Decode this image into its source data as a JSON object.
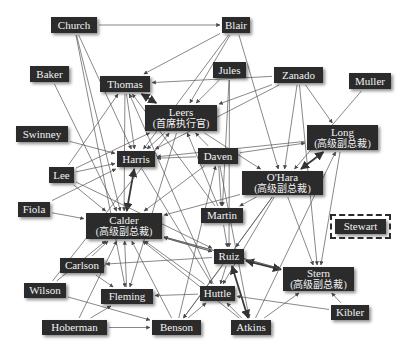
{
  "diagram": {
    "type": "org-network",
    "colors": {
      "node_fill": "#2b2b2b",
      "node_text": "#f2f2f2",
      "edge": "#555555",
      "background": "#ffffff"
    },
    "nodes": [
      {
        "id": "church",
        "label": "Church",
        "sub": "",
        "x": 51,
        "y": 17,
        "w": 46,
        "h": 16
      },
      {
        "id": "blair",
        "label": "Blair",
        "sub": "",
        "x": 222,
        "y": 17,
        "w": 28,
        "h": 16
      },
      {
        "id": "baker",
        "label": "Baker",
        "sub": "",
        "x": 30,
        "y": 66,
        "w": 39,
        "h": 16
      },
      {
        "id": "thomas",
        "label": "Thomas",
        "sub": "",
        "x": 100,
        "y": 76,
        "w": 50,
        "h": 16
      },
      {
        "id": "jules",
        "label": "Jules",
        "sub": "",
        "x": 213,
        "y": 62,
        "w": 33,
        "h": 16
      },
      {
        "id": "zanado",
        "label": "Zanado",
        "sub": "",
        "x": 274,
        "y": 67,
        "w": 49,
        "h": 16
      },
      {
        "id": "muller",
        "label": "Muller",
        "sub": "",
        "x": 349,
        "y": 73,
        "w": 42,
        "h": 16
      },
      {
        "id": "leers",
        "label": "Leers",
        "sub": "(首席执行官)",
        "x": 145,
        "y": 105,
        "w": 72,
        "h": 26
      },
      {
        "id": "swinney",
        "label": "Swinney",
        "sub": "",
        "x": 16,
        "y": 126,
        "w": 52,
        "h": 16
      },
      {
        "id": "long",
        "label": "Long",
        "sub": "(高级副总裁)",
        "x": 307,
        "y": 125,
        "w": 71,
        "h": 25
      },
      {
        "id": "harris",
        "label": "Harris",
        "sub": "",
        "x": 117,
        "y": 151,
        "w": 38,
        "h": 16
      },
      {
        "id": "daven",
        "label": "Daven",
        "sub": "",
        "x": 198,
        "y": 148,
        "w": 40,
        "h": 16
      },
      {
        "id": "lee",
        "label": "Lee",
        "sub": "",
        "x": 49,
        "y": 167,
        "w": 25,
        "h": 16
      },
      {
        "id": "ohara",
        "label": "O'Hara",
        "sub": "(高级副总裁)",
        "x": 242,
        "y": 171,
        "w": 81,
        "h": 24
      },
      {
        "id": "fiola",
        "label": "Fiola",
        "sub": "",
        "x": 18,
        "y": 202,
        "w": 32,
        "h": 15
      },
      {
        "id": "stewart",
        "label": "Stewart",
        "sub": "",
        "x": 335,
        "y": 219,
        "w": 51,
        "h": 15,
        "dashed": true
      },
      {
        "id": "martin",
        "label": "Martin",
        "sub": "",
        "x": 201,
        "y": 208,
        "w": 42,
        "h": 15
      },
      {
        "id": "calder",
        "label": "Calder",
        "sub": "(高级副总裁)",
        "x": 86,
        "y": 213,
        "w": 76,
        "h": 26
      },
      {
        "id": "carlson",
        "label": "Carlson",
        "sub": "",
        "x": 60,
        "y": 258,
        "w": 44,
        "h": 15
      },
      {
        "id": "ruiz",
        "label": "Ruiz",
        "sub": "",
        "x": 214,
        "y": 249,
        "w": 30,
        "h": 15
      },
      {
        "id": "stern",
        "label": "Stern",
        "sub": "(高级副总裁)",
        "x": 283,
        "y": 267,
        "w": 71,
        "h": 24
      },
      {
        "id": "wilson",
        "label": "Wilson",
        "sub": "",
        "x": 24,
        "y": 283,
        "w": 42,
        "h": 15
      },
      {
        "id": "fleming",
        "label": "Fleming",
        "sub": "",
        "x": 101,
        "y": 289,
        "w": 52,
        "h": 15
      },
      {
        "id": "huttle",
        "label": "Huttle",
        "sub": "",
        "x": 200,
        "y": 286,
        "w": 35,
        "h": 15
      },
      {
        "id": "kibler",
        "label": "Kibler",
        "sub": "",
        "x": 331,
        "y": 305,
        "w": 38,
        "h": 15
      },
      {
        "id": "hoberman",
        "label": "Hoberman",
        "sub": "",
        "x": 42,
        "y": 320,
        "w": 65,
        "h": 15
      },
      {
        "id": "benson",
        "label": "Benson",
        "sub": "",
        "x": 152,
        "y": 320,
        "w": 49,
        "h": 15
      },
      {
        "id": "atkins",
        "label": "Atkins",
        "sub": "",
        "x": 231,
        "y": 320,
        "w": 40,
        "h": 15
      }
    ],
    "edges": [
      [
        "church",
        "blair",
        false
      ],
      [
        "church",
        "harris",
        false
      ],
      [
        "church",
        "calder",
        false
      ],
      [
        "church",
        "fleming",
        false
      ],
      [
        "blair",
        "thomas",
        false
      ],
      [
        "blair",
        "leers",
        false
      ],
      [
        "blair",
        "ohara",
        false
      ],
      [
        "blair",
        "harris",
        false
      ],
      [
        "baker",
        "calder",
        false
      ],
      [
        "thomas",
        "leers",
        true
      ],
      [
        "thomas",
        "harris",
        false
      ],
      [
        "thomas",
        "calder",
        false
      ],
      [
        "jules",
        "leers",
        false
      ],
      [
        "jules",
        "martin",
        false
      ],
      [
        "jules",
        "ruiz",
        false
      ],
      [
        "zanado",
        "leers",
        false
      ],
      [
        "zanado",
        "harris",
        false
      ],
      [
        "zanado",
        "ohara",
        false
      ],
      [
        "zanado",
        "long",
        false
      ],
      [
        "zanado",
        "stern",
        false
      ],
      [
        "zanado",
        "thomas",
        false
      ],
      [
        "muller",
        "ohara",
        false
      ],
      [
        "leers",
        "harris",
        false
      ],
      [
        "leers",
        "ohara",
        false
      ],
      [
        "leers",
        "fleming",
        false
      ],
      [
        "swinney",
        "harris",
        false
      ],
      [
        "long",
        "harris",
        false
      ],
      [
        "long",
        "ohara",
        true
      ],
      [
        "long",
        "stern",
        false
      ],
      [
        "harris",
        "calder",
        true
      ],
      [
        "harris",
        "huttle",
        false
      ],
      [
        "daven",
        "long",
        false
      ],
      [
        "daven",
        "harris",
        false
      ],
      [
        "daven",
        "calder",
        false
      ],
      [
        "daven",
        "martin",
        false
      ],
      [
        "daven",
        "atkins",
        false
      ],
      [
        "daven",
        "leers",
        false
      ],
      [
        "lee",
        "harris",
        false
      ],
      [
        "lee",
        "leers",
        false
      ],
      [
        "lee",
        "calder",
        false
      ],
      [
        "lee",
        "ruiz",
        false
      ],
      [
        "lee",
        "thomas",
        false
      ],
      [
        "ohara",
        "calder",
        false
      ],
      [
        "ohara",
        "martin",
        false
      ],
      [
        "ohara",
        "huttle",
        false
      ],
      [
        "ohara",
        "benson",
        false
      ],
      [
        "ohara",
        "stern",
        false
      ],
      [
        "ohara",
        "ruiz",
        false
      ],
      [
        "fiola",
        "calder",
        false
      ],
      [
        "fiola",
        "harris",
        false
      ],
      [
        "martin",
        "ruiz",
        false
      ],
      [
        "martin",
        "thomas",
        false
      ],
      [
        "martin",
        "leers",
        false
      ],
      [
        "calder",
        "ruiz",
        false
      ],
      [
        "calder",
        "stern",
        false
      ],
      [
        "carlson",
        "calder",
        false
      ],
      [
        "carlson",
        "fleming",
        false
      ],
      [
        "ruiz",
        "stern",
        true
      ],
      [
        "ruiz",
        "atkins",
        true
      ],
      [
        "ruiz",
        "calder",
        false
      ],
      [
        "ruiz",
        "carlson",
        false
      ],
      [
        "ruiz",
        "huttle",
        false
      ],
      [
        "ruiz",
        "benson",
        false
      ],
      [
        "stern",
        "calder",
        false
      ],
      [
        "wilson",
        "calder",
        false
      ],
      [
        "wilson",
        "benson",
        false
      ],
      [
        "wilson",
        "leers",
        false
      ],
      [
        "fleming",
        "calder",
        false
      ],
      [
        "huttle",
        "calder",
        false
      ],
      [
        "huttle",
        "fleming",
        false
      ],
      [
        "huttle",
        "thomas",
        false
      ],
      [
        "kibler",
        "stern",
        false
      ],
      [
        "kibler",
        "huttle",
        false
      ],
      [
        "hoberman",
        "fleming",
        false
      ],
      [
        "hoberman",
        "benson",
        false
      ],
      [
        "hoberman",
        "calder",
        false
      ],
      [
        "benson",
        "calder",
        false
      ],
      [
        "benson",
        "daven",
        false
      ],
      [
        "benson",
        "huttle",
        false
      ],
      [
        "atkins",
        "stern",
        false
      ],
      [
        "atkins",
        "huttle",
        false
      ],
      [
        "atkins",
        "calder",
        false
      ],
      [
        "atkins",
        "long",
        false
      ]
    ]
  },
  "caption": ""
}
